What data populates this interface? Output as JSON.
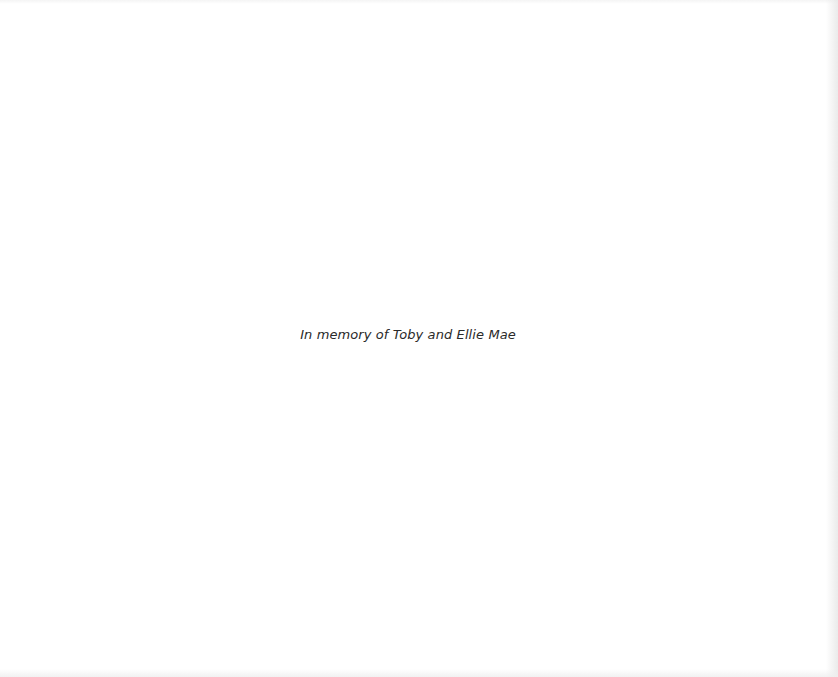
{
  "page": {
    "dedication": "In memory of Toby and Ellie Mae"
  }
}
